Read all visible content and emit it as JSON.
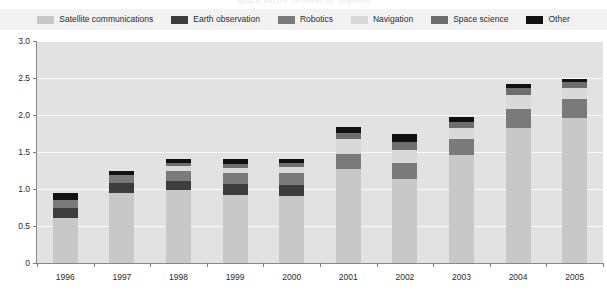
{
  "title": {
    "ghost_text": "Space sector turnover by segment"
  },
  "legend": {
    "position": "top",
    "items": [
      {
        "label": "Satellite communications",
        "color": "#c8c8c8"
      },
      {
        "label": "Earth observation",
        "color": "#3d3d3d"
      },
      {
        "label": "Robotics",
        "color": "#7a7a7a"
      },
      {
        "label": "Navigation",
        "color": "#d9d9d9"
      },
      {
        "label": "Space science",
        "color": "#6e6e6e"
      },
      {
        "label": "Other",
        "color": "#111111"
      }
    ]
  },
  "axes": {
    "y_ticks": [
      "3.0",
      "2.5",
      "2.0",
      "1.5",
      "1.0",
      "0.5",
      "0"
    ],
    "y_values": [
      3.0,
      2.5,
      2.0,
      1.5,
      1.0,
      0.5,
      0
    ],
    "ylim": [
      0,
      3.0
    ],
    "ylabel": "",
    "xlabel": ""
  },
  "chart_data": {
    "type": "bar",
    "stacked": true,
    "title": "",
    "xlabel": "",
    "ylabel": "",
    "ylim": [
      0,
      3.0
    ],
    "grid": true,
    "legend_position": "top",
    "categories": [
      "1996",
      "1997",
      "1998",
      "1999",
      "2000",
      "2001",
      "2002",
      "2003",
      "2004",
      "2005"
    ],
    "series": [
      {
        "name": "Satellite communications",
        "color": "#c8c8c8",
        "values": [
          0.61,
          0.95,
          0.98,
          0.92,
          0.91,
          1.27,
          1.13,
          1.46,
          1.83,
          1.96
        ]
      },
      {
        "name": "Earth observation",
        "color": "#3d3d3d",
        "values": [
          0.13,
          0.13,
          0.13,
          0.15,
          0.15,
          0.0,
          0.0,
          0.0,
          0.0,
          0.0
        ]
      },
      {
        "name": "Robotics",
        "color": "#7a7a7a",
        "values": [
          0.11,
          0.11,
          0.13,
          0.14,
          0.15,
          0.2,
          0.22,
          0.21,
          0.25,
          0.26
        ]
      },
      {
        "name": "Navigation",
        "color": "#d9d9d9",
        "values": [
          0.0,
          0.0,
          0.07,
          0.08,
          0.09,
          0.2,
          0.18,
          0.16,
          0.19,
          0.15
        ]
      },
      {
        "name": "Space science",
        "color": "#6e6e6e",
        "values": [
          0.0,
          0.0,
          0.04,
          0.05,
          0.05,
          0.09,
          0.1,
          0.08,
          0.09,
          0.08
        ]
      },
      {
        "name": "Other",
        "color": "#111111",
        "values": [
          0.1,
          0.06,
          0.06,
          0.07,
          0.06,
          0.08,
          0.12,
          0.06,
          0.06,
          0.04
        ]
      }
    ],
    "totals": [
      0.95,
      1.25,
      1.41,
      1.41,
      1.41,
      1.84,
      1.75,
      1.97,
      2.42,
      2.49
    ]
  }
}
